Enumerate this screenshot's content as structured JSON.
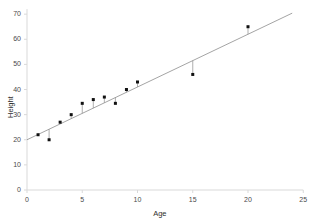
{
  "chart_data": {
    "type": "scatter",
    "title": "",
    "subtitle": "",
    "xlabel": "Age",
    "ylabel": "Height",
    "xlim": [
      0,
      25
    ],
    "ylim": [
      0,
      72
    ],
    "xticks": [
      0,
      5,
      10,
      15,
      20,
      25
    ],
    "yticks": [
      0,
      10,
      20,
      30,
      40,
      50,
      60,
      70
    ],
    "xtick_labels": [
      "0",
      "5",
      "10",
      "15",
      "20",
      "25"
    ],
    "ytick_labels": [
      "0",
      "10",
      "20",
      "30",
      "40",
      "50",
      "60",
      "70"
    ],
    "grid": false,
    "legend": null,
    "legend_position": "none",
    "x": [
      1,
      2,
      3,
      4,
      5,
      6,
      7,
      8,
      9,
      10,
      15,
      20
    ],
    "y": [
      22,
      20,
      27,
      30,
      34.5,
      36,
      37,
      34.5,
      40,
      43,
      46,
      65
    ],
    "points": [
      {
        "age": 1,
        "height": 22
      },
      {
        "age": 2,
        "height": 20
      },
      {
        "age": 3,
        "height": 27
      },
      {
        "age": 4,
        "height": 30
      },
      {
        "age": 5,
        "height": 34.5
      },
      {
        "age": 6,
        "height": 36
      },
      {
        "age": 7,
        "height": 37
      },
      {
        "age": 8,
        "height": 34.5
      },
      {
        "age": 9,
        "height": 40
      },
      {
        "age": 10,
        "height": 43
      },
      {
        "age": 15,
        "height": 46
      },
      {
        "age": 20,
        "height": 65
      }
    ],
    "fit_line": {
      "type": "linear",
      "intercept": 20.0,
      "slope": 2.1,
      "x_start": 0,
      "x_end": 24,
      "y_start": 20.0,
      "y_end": 70.4
    },
    "residual_lines": true,
    "marker": "square",
    "marker_size": 3,
    "colors": {
      "marker": "#111111",
      "line": "#8d8d8d",
      "residual": "#8d8d8d",
      "axis": "#d9d9d9",
      "tick_text": "#4a4a4a",
      "background": "#ffffff"
    }
  },
  "axes": {
    "x_title": "Age",
    "y_title": "Height"
  }
}
